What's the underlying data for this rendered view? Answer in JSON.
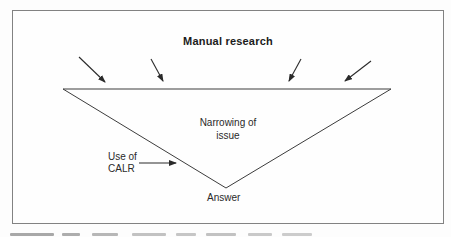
{
  "figure": {
    "title": "Manual research",
    "funnel": {
      "narrowing_line1": "Narrowing of",
      "narrowing_line2": "issue",
      "calr_line1": "Use of",
      "calr_line2": "CALR",
      "apex_label": "Answer"
    },
    "icons": [
      "manual-research-arrow-down-right-icon",
      "manual-research-arrow-down-right-icon",
      "manual-research-arrow-down-left-icon",
      "manual-research-arrow-down-left-icon",
      "calr-arrow-right-icon"
    ],
    "colors": {
      "line": "#3d3d3d",
      "arrow": "#2a2a2a",
      "text": "#1b1b1b",
      "panel_border": "#828282",
      "background": "#fefefe"
    }
  }
}
